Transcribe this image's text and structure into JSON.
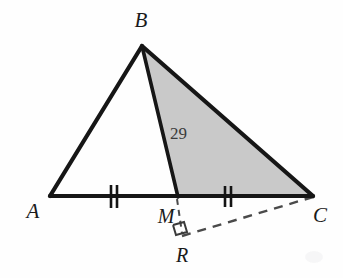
{
  "figure": {
    "background_color": "#fefefe",
    "stroke_color": "#1a1a1a",
    "shaded_fill": "#c9c9c9",
    "dashed_color": "#555555",
    "label_color": "#1a1a1a"
  },
  "points": {
    "A": {
      "label": "A",
      "x": 50,
      "y": 196,
      "label_x": 33,
      "label_y": 216
    },
    "B": {
      "label": "B",
      "x": 142,
      "y": 46,
      "label_x": 141,
      "label_y": 25
    },
    "C": {
      "label": "C",
      "x": 313,
      "y": 196,
      "label_x": 318,
      "label_y": 220
    },
    "M": {
      "label": "M",
      "x": 178,
      "y": 196,
      "label_x": 166,
      "label_y": 221
    },
    "R": {
      "label": "R",
      "x": 182,
      "y": 236,
      "label_x": 181,
      "label_y": 260
    }
  },
  "segments": {
    "AB": {
      "name": "AB",
      "style": "solid",
      "from": "A",
      "to": "B"
    },
    "BC": {
      "name": "BC",
      "style": "solid",
      "from": "B",
      "to": "C"
    },
    "AC": {
      "name": "AC",
      "style": "solid",
      "from": "A",
      "to": "C"
    },
    "BM": {
      "name": "BM",
      "style": "solid",
      "from": "B",
      "to": "M"
    },
    "MR": {
      "name": "MR",
      "style": "dashed",
      "from": "M",
      "to": "R"
    },
    "RC": {
      "name": "RC",
      "style": "dashed",
      "from": "R",
      "to": "C"
    }
  },
  "shaded_region": {
    "name": "triangle-BMC",
    "vertices": "B, M, C",
    "fill": "#c9c9c9"
  },
  "tick_marks": {
    "count_per_mark": 2,
    "marks": [
      {
        "name": "tick-AM",
        "x": 114,
        "y": 196
      },
      {
        "name": "tick-MC",
        "x": 228,
        "y": 196
      }
    ]
  },
  "angle_label": {
    "text": "29",
    "x": 170,
    "y": 138
  },
  "right_angle": {
    "at": "R",
    "size": 11
  }
}
